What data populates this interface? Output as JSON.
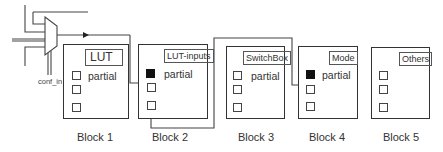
{
  "diagram": {
    "mux": {
      "control_label": "conf_in"
    },
    "blocks": [
      {
        "id": "block1",
        "label": "Block 1",
        "tag": "LUT",
        "partial": "partial",
        "first_square_filled": false
      },
      {
        "id": "block2",
        "label": "Block 2",
        "tag": "LUT-inputs",
        "partial": "partial",
        "first_square_filled": true
      },
      {
        "id": "block3",
        "label": "Block 3",
        "tag": "SwitchBox",
        "partial": "partial",
        "first_square_filled": false
      },
      {
        "id": "block4",
        "label": "Block 4",
        "tag": "Mode",
        "partial": "partial",
        "first_square_filled": true
      },
      {
        "id": "block5",
        "label": "Block 5",
        "tag": "Others",
        "partial": "",
        "first_square_filled": false
      }
    ],
    "colors": {
      "line": "#333333",
      "filled_square": "#111111",
      "background": "#ffffff"
    }
  }
}
